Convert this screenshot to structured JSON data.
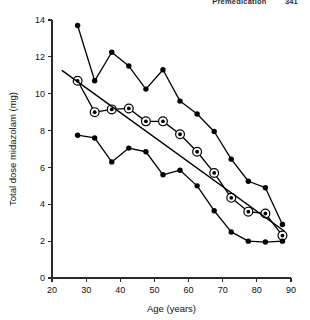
{
  "page": {
    "running_head": "Premedication",
    "page_number": "341"
  },
  "chart_data": {
    "type": "line",
    "title": "",
    "xlabel": "Age (years)",
    "ylabel": "Total dose midazolam (mg)",
    "xlim": [
      20,
      90
    ],
    "ylim": [
      0,
      14
    ],
    "xticks": [
      20,
      30,
      40,
      50,
      60,
      70,
      80,
      90
    ],
    "yticks": [
      0,
      2,
      4,
      6,
      8,
      10,
      12,
      14
    ],
    "grid": false,
    "legend": "none",
    "marker_styles": {
      "upper_percentile": "filled-circle",
      "lower_percentile": "filled-circle",
      "median_observed": "filled-circle-in-open-ring",
      "regression": "plain-line"
    },
    "series": [
      {
        "name": "Upper percentile",
        "marker": "filled-circle",
        "x": [
          27.5,
          32.5,
          37.5,
          42.5,
          47.5,
          52.5,
          57.5,
          62.5,
          67.5,
          72.5,
          77.5,
          82.5,
          87.5
        ],
        "values": [
          13.7,
          10.7,
          12.25,
          11.5,
          10.25,
          11.3,
          9.6,
          8.9,
          7.95,
          6.45,
          5.25,
          4.9,
          2.9
        ]
      },
      {
        "name": "Median observed dose",
        "marker": "filled-circle-in-open-ring",
        "x": [
          27.5,
          32.5,
          37.5,
          42.5,
          47.5,
          52.5,
          57.5,
          62.5,
          67.5,
          72.5,
          77.5,
          82.5,
          87.5
        ],
        "values": [
          10.7,
          9.0,
          9.15,
          9.2,
          8.5,
          8.5,
          7.8,
          6.85,
          5.7,
          4.35,
          3.6,
          3.5,
          2.3
        ]
      },
      {
        "name": "Lower percentile",
        "marker": "filled-circle",
        "x": [
          27.5,
          32.5,
          37.5,
          42.5,
          47.5,
          52.5,
          57.5,
          62.5,
          67.5,
          72.5,
          77.5,
          82.5,
          87.5
        ],
        "values": [
          7.75,
          7.6,
          6.3,
          7.05,
          6.85,
          5.6,
          5.85,
          5.0,
          3.65,
          2.5,
          2.0,
          1.95,
          2.0
        ]
      },
      {
        "name": "Regression line",
        "marker": "none",
        "x": [
          23,
          88
        ],
        "values": [
          11.25,
          2.55
        ]
      }
    ]
  }
}
